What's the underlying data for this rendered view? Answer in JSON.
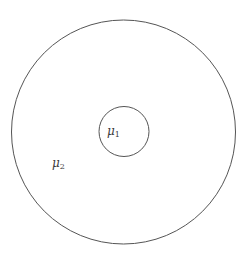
{
  "diagram": {
    "stroke_color": "#555555",
    "background": "#ffffff",
    "outer_circle": {
      "cx": 123.5,
      "cy": 132,
      "r": 112
    },
    "inner_circle": {
      "cx": 124,
      "cy": 131.5,
      "r": 25
    },
    "labels": {
      "inner": {
        "symbol": "μ",
        "subscript": "1"
      },
      "outer": {
        "symbol": "μ",
        "subscript": "2"
      }
    }
  }
}
